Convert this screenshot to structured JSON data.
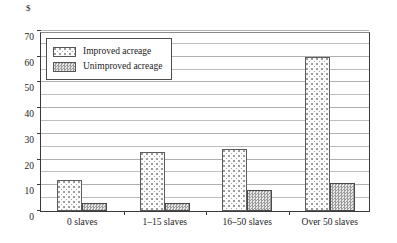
{
  "chart_data": {
    "type": "bar",
    "title": "",
    "xlabel": "",
    "ylabel": "$",
    "unit_label": "$",
    "categories": [
      "0 slaves",
      "1–15 slaves",
      "16–50 slaves",
      "Over 50 slaves"
    ],
    "series": [
      {
        "name": "Improved acreage",
        "values": [
          12,
          23,
          24,
          60
        ]
      },
      {
        "name": "Unimproved acreage",
        "values": [
          3,
          3,
          8,
          11
        ]
      }
    ],
    "ylim": [
      0,
      70
    ],
    "ytick_labels": [
      "0",
      "10",
      "20",
      "30",
      "40",
      "50",
      "60",
      "70"
    ],
    "ytick_values": [
      0,
      10,
      20,
      30,
      40,
      50,
      60,
      70
    ],
    "gridline_values": [
      5,
      10,
      15,
      20,
      25,
      30,
      35,
      40,
      45,
      50,
      55,
      60,
      65,
      70
    ],
    "grid": true,
    "legend_position": "top-left",
    "legend": [
      {
        "label": "Improved acreage",
        "pattern": "light-dotted"
      },
      {
        "label": "Unimproved acreage",
        "pattern": "gray-checker"
      }
    ],
    "colors": {
      "axis": "#3a3a3a",
      "gridline": "#bdbdbd",
      "improved_fill": "#fbfbfb",
      "unimproved_fill": "#e3e3e3",
      "background": "#ffffff"
    }
  }
}
